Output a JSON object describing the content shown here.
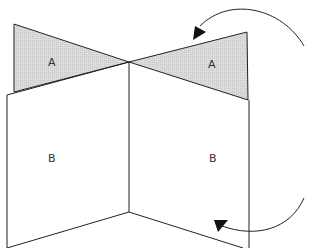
{
  "diagram": {
    "labels": {
      "triangle_left": "A",
      "triangle_right": "A",
      "panel_left": "B",
      "panel_right": "B"
    },
    "colors": {
      "shaded_fill": "#d9d9d9",
      "stroke": "#222222",
      "background": "#ffffff"
    },
    "arrows": [
      {
        "name": "upper-curved-arrow",
        "direction": "counter-clockwise toward right triangle A"
      },
      {
        "name": "lower-curved-arrow",
        "direction": "curving toward right panel B"
      }
    ]
  }
}
